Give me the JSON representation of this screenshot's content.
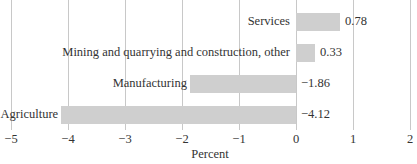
{
  "chart_data": {
    "type": "bar",
    "orientation": "horizontal",
    "title": "",
    "categories": [
      "Services",
      "Mining and quarrying and construction, other",
      "Manufacturing",
      "Agriculture"
    ],
    "values": [
      0.78,
      0.33,
      -1.86,
      -4.12
    ],
    "value_labels": [
      "0.78",
      "0.33",
      "−1.86",
      "−4.12"
    ],
    "xlabel": "Percent",
    "ylabel": "",
    "xlim": [
      -5,
      2
    ],
    "xticks": [
      -5,
      -4,
      -3,
      -2,
      -1,
      0,
      1,
      2
    ],
    "xtick_labels": [
      "−5",
      "−4",
      "−3",
      "−2",
      "−1",
      "0",
      "1",
      "2"
    ],
    "grid": "vertical",
    "legend": "none",
    "bar_color": "#cfcfcf"
  }
}
